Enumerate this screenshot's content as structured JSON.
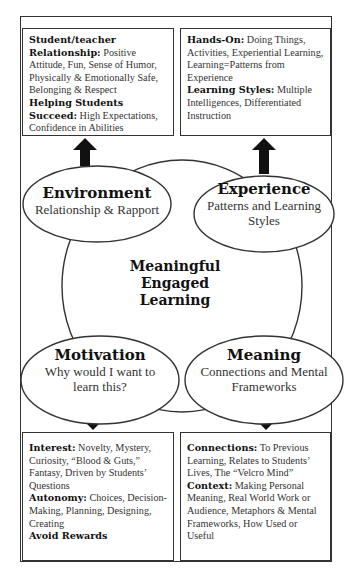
{
  "center": {
    "line1": "Meaningful",
    "line2": "Engaged",
    "line3": "Learning"
  },
  "ellipses": {
    "environment": {
      "title": "Environment",
      "subtitle": "Relationship & Rapport"
    },
    "experience": {
      "title": "Experience",
      "subtitle": "Patterns and Learning Styles"
    },
    "motivation": {
      "title": "Motivation",
      "subtitle": "Why would I want to learn this?"
    },
    "meaning": {
      "title": "Meaning",
      "subtitle": "Connections and Mental Frameworks"
    }
  },
  "boxes": {
    "environment": {
      "items": [
        {
          "heading": "Student/teacher Relationship:",
          "text": " Positive Attitude, Fun, Sense of Humor, Physically & Emotionally Safe, Belonging & Respect"
        },
        {
          "heading": "Helping Students Succeed:",
          "text": " High Expectations, Confidence in Abilities"
        }
      ]
    },
    "experience": {
      "items": [
        {
          "heading": "Hands-On:",
          "text": " Doing Things, Activities, Experiential Learning, Learning=Patterns from Experience"
        },
        {
          "heading": "Learning Styles:",
          "text": " Multiple Intelligences, Differentiated Instruction"
        }
      ]
    },
    "motivation": {
      "items": [
        {
          "heading": "Interest:",
          "text": " Novelty, Mystery, Curiosity, “Blood & Guts,” Fantasy, Driven by Students’ Questions"
        },
        {
          "heading": "Autonomy:",
          "text": " Choices, Decision-Making, Planning, Designing, Creating"
        },
        {
          "heading": "Avoid Rewards",
          "text": ""
        }
      ]
    },
    "meaning": {
      "items": [
        {
          "heading": "Connections:",
          "text": " To Previous Learning, Relates to Students’ Lives, The “Velcro Mind”"
        },
        {
          "heading": "Context:",
          "text": " Making Personal Meaning, Real World Work or Audience, Metaphors & Mental Frameworks, How Used or Useful"
        }
      ]
    }
  },
  "colors": {
    "line": "#333333",
    "arrow": "#111111",
    "background": "#ffffff"
  }
}
